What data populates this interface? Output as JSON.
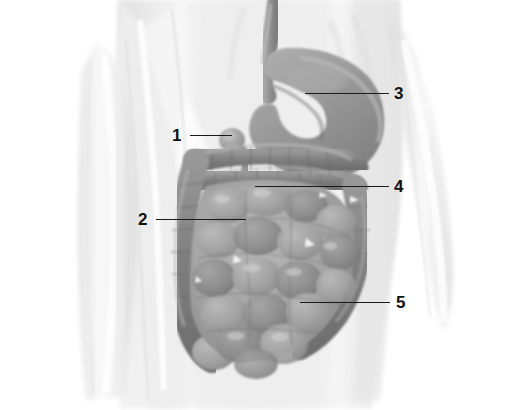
{
  "figure": {
    "width": 514,
    "height": 410,
    "background_color": "#ffffff",
    "style": "grayscale medical illustration"
  },
  "colors": {
    "background": "#ffffff",
    "body_silhouette": "#e9e9e9",
    "body_silhouette_shadow": "#d4d4d4",
    "body_outline": "#cfcfcf",
    "organ_mid": "#8d8d8d",
    "organ_dark": "#6f6f6f",
    "organ_light": "#a8a8a8",
    "organ_highlight": "#c2c2c2",
    "label_text": "#111111",
    "leader_line": "#1a1a1a"
  },
  "organs": [
    {
      "name": "esophagus",
      "tone": "#8a8a8a"
    },
    {
      "name": "stomach",
      "tone": "#8d8d8d"
    },
    {
      "name": "duodenum",
      "tone": "#7e7e7e"
    },
    {
      "name": "transverse-colon",
      "tone": "#757575"
    },
    {
      "name": "ascending-colon",
      "tone": "#7a7a7a"
    },
    {
      "name": "descending-colon",
      "tone": "#838383"
    },
    {
      "name": "small-intestine",
      "tone": "#9a9a9a"
    },
    {
      "name": "sigmoid-colon",
      "tone": "#878787"
    }
  ],
  "callouts": [
    {
      "id": "callout-1",
      "label": "1",
      "target_organ": "duodenum",
      "text_x": 172,
      "text_y": 127,
      "line_x": 190,
      "line_y": 135,
      "line_width": 42,
      "side": "left"
    },
    {
      "id": "callout-2",
      "label": "2",
      "target_organ": "small-intestine",
      "text_x": 138,
      "text_y": 211,
      "line_x": 156,
      "line_y": 219,
      "line_width": 90,
      "side": "left"
    },
    {
      "id": "callout-3",
      "label": "3",
      "target_organ": "stomach",
      "text_x": 394,
      "text_y": 85,
      "line_x": 305,
      "line_y": 93,
      "line_width": 84,
      "side": "right"
    },
    {
      "id": "callout-4",
      "label": "4",
      "target_organ": "transverse-colon",
      "text_x": 394,
      "text_y": 178,
      "line_x": 255,
      "line_y": 186,
      "line_width": 134,
      "side": "right"
    },
    {
      "id": "callout-5",
      "label": "5",
      "target_organ": "descending-colon",
      "text_x": 396,
      "text_y": 294,
      "line_x": 300,
      "line_y": 302,
      "line_width": 90,
      "side": "right"
    }
  ]
}
